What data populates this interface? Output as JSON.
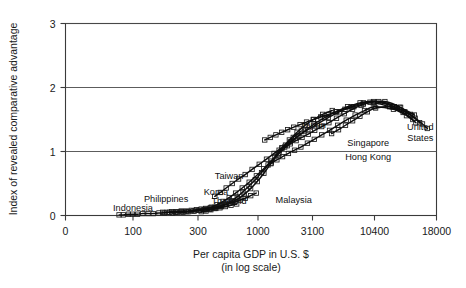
{
  "chart_data": {
    "type": "scatter",
    "title": "",
    "xlabel": "Per capita GDP in U.S. $",
    "xlabel_sub": "(in log scale)",
    "ylabel": "Index of revealed comparative advantage",
    "x_scale": "log",
    "xticks": [
      0,
      100,
      300,
      1000,
      3100,
      10400,
      18000
    ],
    "xtick_labels": [
      "0",
      "100",
      "300",
      "1000",
      "3100",
      "10400",
      "18000"
    ],
    "yticks": [
      0,
      1,
      2,
      3
    ],
    "ytick_labels": [
      "0",
      "1",
      "2",
      "3"
    ],
    "xlim": [
      0,
      18000
    ],
    "ylim": [
      0,
      3
    ],
    "grid": "horizontal-at-1-2-3",
    "legend_position": "none",
    "marker_style": "open-square",
    "annotations": [
      {
        "label": "Indonesia",
        "x": 100,
        "y": 0.07
      },
      {
        "label": "Philippines",
        "x": 175,
        "y": 0.21
      },
      {
        "label": "Thailand",
        "x": 560,
        "y": 0.18
      },
      {
        "label": "Korea",
        "x": 430,
        "y": 0.32
      },
      {
        "label": "Taiwan",
        "x": 560,
        "y": 0.57
      },
      {
        "label": "Malaysia",
        "x": 2100,
        "y": 0.2
      },
      {
        "label": "Japan",
        "x": 3150,
        "y": 1.36
      },
      {
        "label": "Singapore",
        "x": 9200,
        "y": 1.08
      },
      {
        "label": "Hong Kong",
        "x": 9200,
        "y": 0.87
      },
      {
        "label": "United States",
        "x": 15600,
        "y": 1.33
      }
    ],
    "series": [
      {
        "name": "Indonesia",
        "points": [
          [
            78,
            0.01
          ],
          [
            84,
            0.01
          ],
          [
            92,
            0.02
          ],
          [
            99,
            0.02
          ],
          [
            108,
            0.02
          ],
          [
            118,
            0.03
          ],
          [
            129,
            0.03
          ],
          [
            141,
            0.03
          ],
          [
            155,
            0.04
          ],
          [
            170,
            0.04
          ],
          [
            186,
            0.05
          ],
          [
            205,
            0.05
          ],
          [
            226,
            0.06
          ],
          [
            249,
            0.06
          ],
          [
            276,
            0.07
          ],
          [
            305,
            0.08
          ],
          [
            338,
            0.09
          ],
          [
            376,
            0.1
          ],
          [
            418,
            0.11
          ],
          [
            466,
            0.12
          ],
          [
            520,
            0.14
          ],
          [
            582,
            0.16
          ],
          [
            652,
            0.18
          ]
        ]
      },
      {
        "name": "Philippines",
        "points": [
          [
            165,
            0.05
          ],
          [
            178,
            0.05
          ],
          [
            192,
            0.06
          ],
          [
            208,
            0.06
          ],
          [
            226,
            0.07
          ],
          [
            246,
            0.07
          ],
          [
            268,
            0.08
          ],
          [
            292,
            0.09
          ],
          [
            320,
            0.1
          ],
          [
            350,
            0.11
          ],
          [
            384,
            0.12
          ],
          [
            422,
            0.13
          ],
          [
            465,
            0.15
          ],
          [
            513,
            0.17
          ],
          [
            567,
            0.19
          ],
          [
            628,
            0.21
          ],
          [
            697,
            0.24
          ],
          [
            775,
            0.27
          ],
          [
            864,
            0.31
          ],
          [
            965,
            0.35
          ]
        ]
      },
      {
        "name": "Thailand",
        "points": [
          [
            195,
            0.04
          ],
          [
            213,
            0.05
          ],
          [
            233,
            0.05
          ],
          [
            256,
            0.06
          ],
          [
            282,
            0.07
          ],
          [
            311,
            0.08
          ],
          [
            344,
            0.09
          ],
          [
            381,
            0.1
          ],
          [
            424,
            0.12
          ],
          [
            473,
            0.14
          ],
          [
            529,
            0.17
          ],
          [
            594,
            0.21
          ],
          [
            670,
            0.26
          ],
          [
            758,
            0.33
          ],
          [
            862,
            0.42
          ],
          [
            985,
            0.53
          ],
          [
            1130,
            0.66
          ],
          [
            1305,
            0.81
          ],
          [
            1515,
            0.96
          ],
          [
            1770,
            1.1
          ],
          [
            2080,
            1.22
          ],
          [
            2460,
            1.32
          ]
        ]
      },
      {
        "name": "Malaysia",
        "points": [
          [
            320,
            0.06
          ],
          [
            352,
            0.07
          ],
          [
            388,
            0.09
          ],
          [
            429,
            0.11
          ],
          [
            475,
            0.14
          ],
          [
            528,
            0.18
          ],
          [
            589,
            0.23
          ],
          [
            659,
            0.29
          ],
          [
            740,
            0.37
          ],
          [
            835,
            0.46
          ],
          [
            946,
            0.56
          ],
          [
            1077,
            0.67
          ],
          [
            1233,
            0.79
          ],
          [
            1420,
            0.92
          ],
          [
            1645,
            1.05
          ],
          [
            1918,
            1.18
          ],
          [
            2250,
            1.3
          ],
          [
            2660,
            1.41
          ],
          [
            3160,
            1.5
          ],
          [
            3780,
            1.58
          ],
          [
            4560,
            1.64
          ]
        ]
      },
      {
        "name": "Korea",
        "points": [
          [
            350,
            0.1
          ],
          [
            392,
            0.13
          ],
          [
            440,
            0.17
          ],
          [
            496,
            0.22
          ],
          [
            561,
            0.28
          ],
          [
            638,
            0.35
          ],
          [
            729,
            0.43
          ],
          [
            838,
            0.52
          ],
          [
            968,
            0.62
          ],
          [
            1125,
            0.73
          ],
          [
            1315,
            0.85
          ],
          [
            1548,
            0.97
          ],
          [
            1835,
            1.09
          ],
          [
            2190,
            1.21
          ],
          [
            2635,
            1.32
          ],
          [
            3200,
            1.43
          ],
          [
            3930,
            1.53
          ],
          [
            4880,
            1.62
          ],
          [
            6150,
            1.7
          ],
          [
            7850,
            1.76
          ],
          [
            10200,
            1.78
          ],
          [
            12400,
            1.7
          ],
          [
            14300,
            1.58
          ]
        ]
      },
      {
        "name": "Taiwan",
        "points": [
          [
            420,
            0.3
          ],
          [
            470,
            0.36
          ],
          [
            528,
            0.43
          ],
          [
            596,
            0.5
          ],
          [
            677,
            0.57
          ],
          [
            773,
            0.64
          ],
          [
            888,
            0.72
          ],
          [
            1026,
            0.8
          ],
          [
            1193,
            0.88
          ],
          [
            1396,
            0.97
          ],
          [
            1645,
            1.06
          ],
          [
            1952,
            1.15
          ],
          [
            2335,
            1.25
          ],
          [
            2815,
            1.34
          ],
          [
            3425,
            1.43
          ],
          [
            4210,
            1.53
          ],
          [
            5230,
            1.62
          ],
          [
            6580,
            1.7
          ],
          [
            8380,
            1.76
          ],
          [
            10800,
            1.78
          ],
          [
            13000,
            1.69
          ],
          [
            14800,
            1.57
          ]
        ]
      },
      {
        "name": "Hong Kong",
        "points": [
          [
            1150,
            1.18
          ],
          [
            1290,
            1.22
          ],
          [
            1450,
            1.26
          ],
          [
            1635,
            1.3
          ],
          [
            1850,
            1.34
          ],
          [
            2100,
            1.38
          ],
          [
            2395,
            1.42
          ],
          [
            2740,
            1.46
          ],
          [
            3150,
            1.5
          ],
          [
            3640,
            1.54
          ],
          [
            4230,
            1.58
          ],
          [
            4950,
            1.62
          ],
          [
            5840,
            1.66
          ],
          [
            6950,
            1.7
          ],
          [
            8350,
            1.74
          ],
          [
            10150,
            1.76
          ],
          [
            11900,
            1.7
          ],
          [
            13400,
            1.61
          ],
          [
            14600,
            1.5
          ]
        ]
      },
      {
        "name": "Singapore",
        "points": [
          [
            1320,
            0.82
          ],
          [
            1480,
            0.87
          ],
          [
            1665,
            0.92
          ],
          [
            1880,
            0.97
          ],
          [
            2135,
            1.02
          ],
          [
            2435,
            1.07
          ],
          [
            2790,
            1.13
          ],
          [
            3210,
            1.19
          ],
          [
            3715,
            1.26
          ],
          [
            4325,
            1.33
          ],
          [
            5070,
            1.41
          ],
          [
            5990,
            1.49
          ],
          [
            7130,
            1.57
          ],
          [
            8560,
            1.64
          ],
          [
            10350,
            1.7
          ],
          [
            12300,
            1.66
          ],
          [
            13800,
            1.56
          ],
          [
            15000,
            1.45
          ]
        ]
      },
      {
        "name": "Japan",
        "points": [
          [
            1550,
            1.02
          ],
          [
            1740,
            1.07
          ],
          [
            1955,
            1.12
          ],
          [
            2205,
            1.17
          ],
          [
            2495,
            1.22
          ],
          [
            2835,
            1.27
          ],
          [
            3235,
            1.33
          ],
          [
            3705,
            1.39
          ],
          [
            4270,
            1.45
          ],
          [
            4950,
            1.52
          ],
          [
            5770,
            1.59
          ],
          [
            6770,
            1.66
          ],
          [
            8000,
            1.72
          ],
          [
            9520,
            1.77
          ],
          [
            11400,
            1.78
          ],
          [
            13100,
            1.69
          ],
          [
            14500,
            1.56
          ],
          [
            15500,
            1.45
          ]
        ]
      },
      {
        "name": "United States",
        "points": [
          [
            4500,
            1.28
          ],
          [
            5150,
            1.34
          ],
          [
            5900,
            1.41
          ],
          [
            6780,
            1.48
          ],
          [
            7820,
            1.55
          ],
          [
            9050,
            1.62
          ],
          [
            10500,
            1.68
          ],
          [
            12200,
            1.7
          ],
          [
            13600,
            1.62
          ],
          [
            14900,
            1.52
          ],
          [
            15900,
            1.43
          ],
          [
            16600,
            1.36
          ]
        ]
      }
    ]
  }
}
